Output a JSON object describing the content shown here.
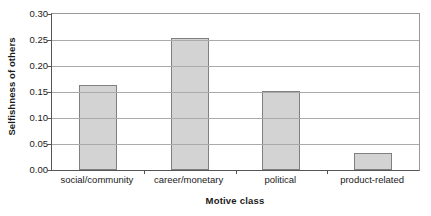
{
  "chart_data": {
    "type": "bar",
    "title": "",
    "subtitle": "",
    "categories": [
      "social/community",
      "career/monetary",
      "political",
      "product-related"
    ],
    "values": [
      0.164,
      0.253,
      0.151,
      0.033
    ],
    "xlabel": "Motive class",
    "ylabel": "Selfishness of others",
    "ylim": [
      0.0,
      0.3
    ],
    "ytick_labels": [
      "0.00",
      "0.05",
      "0.10",
      "0.15",
      "0.20",
      "0.25",
      "0.30"
    ],
    "ytick_values": [
      0.0,
      0.05,
      0.1,
      0.15,
      0.2,
      0.25,
      0.3
    ],
    "grid": "horizontal",
    "legend": "none",
    "bar_fill_color": "#d3d3d3",
    "bar_border_color": "#808080",
    "axis_color": "#555555",
    "gridline_color": "#aaaaaa",
    "background_color": "#ffffff",
    "text_color": "#1a1a1a"
  }
}
